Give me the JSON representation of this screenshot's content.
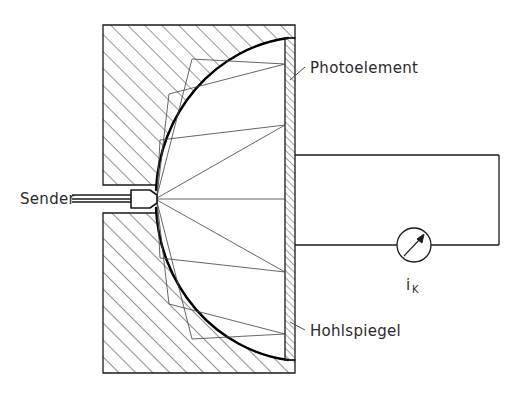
{
  "figure": {
    "type": "technical-diagram",
    "background_color": "#ffffff",
    "line_color": "#1a1a1a",
    "hatch_color": "#3a3a3a"
  },
  "labels": {
    "sender": "Sender",
    "photoelement": "Photoelement",
    "hohlspiegel": "Hohlspiegel",
    "current_symbol": "i",
    "current_subscript": "K"
  },
  "components": {
    "mirror_block": {
      "name": "Hohlspiegel",
      "x": 103,
      "y": 25,
      "width": 192,
      "height": 348,
      "hatch_angle_deg": 45
    },
    "photoelement": {
      "name": "Photoelement",
      "x": 285,
      "y": 38,
      "width": 10,
      "height": 322,
      "hatch_angle_deg": 45
    },
    "sender": {
      "name": "Sender",
      "box_x": 130,
      "box_y": 190,
      "box_width": 26,
      "box_height": 18
    },
    "meter": {
      "name": "Strommessgeraet",
      "center_x": 414,
      "center_y": 245,
      "radius": 17,
      "needle_angle_deg": 55
    },
    "circuit": {
      "top_wire_y": 155,
      "bottom_wire_y": 245,
      "left_x": 295,
      "right_x": 499
    }
  },
  "rays": {
    "count": 9,
    "description": "Strahlen vom Sender zum Hohlspiegel und reflektiert zum Photoelement"
  }
}
